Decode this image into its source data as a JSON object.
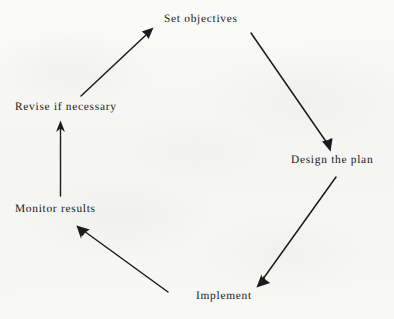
{
  "diagram": {
    "type": "cycle-flow-diagram",
    "direction": "clockwise",
    "background_color": "#f7f7f6",
    "ink_color": "#1b1b1b",
    "nodes": [
      {
        "id": "set-objectives",
        "label": "Set objectives"
      },
      {
        "id": "design-the-plan",
        "label": "Design the plan"
      },
      {
        "id": "implement",
        "label": "Implement"
      },
      {
        "id": "monitor-results",
        "label": "Monitor results"
      },
      {
        "id": "revise-if-necessary",
        "label": "Revise if necessary"
      }
    ],
    "arrows": [
      {
        "id": "arrow-set-objectives-to-design-the-plan",
        "from": "set-objectives",
        "to": "design-the-plan",
        "head": "filled-triangle"
      },
      {
        "id": "arrow-design-the-plan-to-implement",
        "from": "design-the-plan",
        "to": "implement",
        "head": "barbed-chevron"
      },
      {
        "id": "arrow-implement-to-monitor-results",
        "from": "implement",
        "to": "monitor-results",
        "head": "barbed-chevron"
      },
      {
        "id": "arrow-monitor-results-to-revise",
        "from": "monitor-results",
        "to": "revise-if-necessary",
        "head": "barbed-chevron"
      },
      {
        "id": "arrow-revise-to-set-objectives",
        "from": "revise-if-necessary",
        "to": "set-objectives",
        "head": "filled-triangle"
      }
    ]
  }
}
